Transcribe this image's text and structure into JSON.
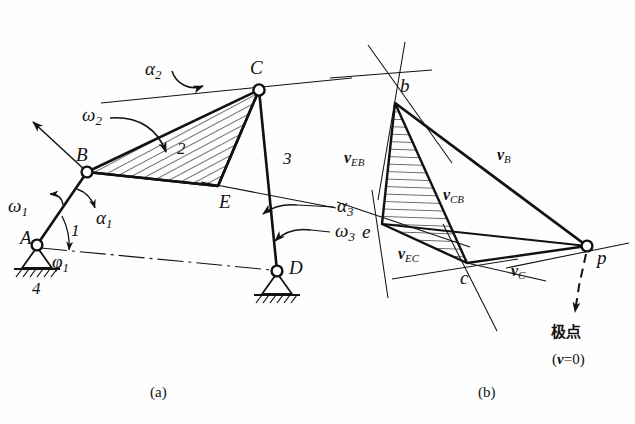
{
  "figure": {
    "title_a": "(a)",
    "title_b": "(b)",
    "pole_label": "极点",
    "pole_value": "(v=0)"
  },
  "mechanism": {
    "joints": [
      {
        "name": "A",
        "label": "A",
        "x": 37,
        "y": 245,
        "type": "fixed-pivot"
      },
      {
        "name": "B",
        "label": "B",
        "x": 87,
        "y": 172,
        "type": "pin"
      },
      {
        "name": "C",
        "label": "C",
        "x": 259,
        "y": 90,
        "type": "pin"
      },
      {
        "name": "D",
        "label": "D",
        "x": 277,
        "y": 271,
        "type": "fixed-pivot"
      },
      {
        "name": "E",
        "label": "E",
        "x": 218,
        "y": 186,
        "type": "point"
      }
    ],
    "links": [
      {
        "label": "1",
        "from": "A",
        "to": "B"
      },
      {
        "label": "2",
        "from": "B",
        "to": "C"
      },
      {
        "label": "3",
        "from": "C",
        "to": "D"
      },
      {
        "label": "4",
        "from": "A",
        "to": "D"
      }
    ],
    "annotations": [
      {
        "name": "omega-1",
        "base": "ω",
        "sub": "1"
      },
      {
        "name": "alpha-1",
        "base": "α",
        "sub": "1"
      },
      {
        "name": "phi-1",
        "base": "φ",
        "sub": "1"
      },
      {
        "name": "omega-2",
        "base": "ω",
        "sub": "2"
      },
      {
        "name": "alpha-2",
        "base": "α",
        "sub": "2"
      },
      {
        "name": "omega-3",
        "base": "ω",
        "sub": "3"
      },
      {
        "name": "alpha-3",
        "base": "α",
        "sub": "3"
      }
    ]
  },
  "velocity_polygon": {
    "points": [
      {
        "name": "b",
        "label": "b",
        "x": 395,
        "y": 103
      },
      {
        "name": "e",
        "label": "e",
        "x": 382,
        "y": 224
      },
      {
        "name": "c",
        "label": "c",
        "x": 467,
        "y": 263
      },
      {
        "name": "p",
        "label": "p",
        "x": 587,
        "y": 246
      }
    ],
    "vectors": [
      {
        "name": "v-B",
        "base": "v",
        "sub": "B"
      },
      {
        "name": "v-C",
        "base": "v",
        "sub": "C"
      },
      {
        "name": "v-EB",
        "base": "v",
        "sub": "EB"
      },
      {
        "name": "v-CB",
        "base": "v",
        "sub": "CB"
      },
      {
        "name": "v-EC",
        "base": "v",
        "sub": "EC"
      }
    ]
  },
  "style": {
    "ink": "#111111",
    "paper": "#fefefe",
    "hatch": "#1a1a1a"
  }
}
